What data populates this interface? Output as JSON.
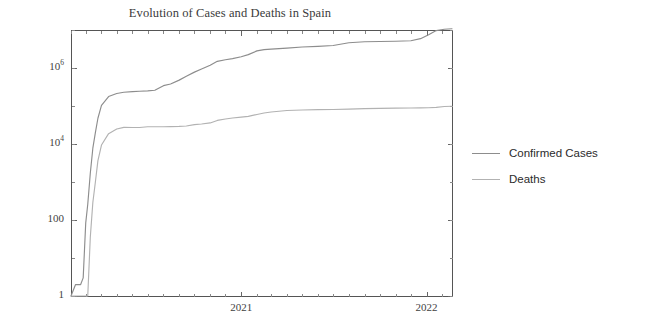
{
  "chart_data": {
    "type": "line",
    "title": "Evolution of Cases and Deaths in Spain",
    "xlabel": "",
    "ylabel": "",
    "yscale": "log",
    "ylim": [
      1,
      10000000
    ],
    "grid": false,
    "legend_position": "right",
    "y_ticks": [
      {
        "value": 1,
        "label": "1",
        "exponent": ""
      },
      {
        "value": 100,
        "label": "100",
        "exponent": ""
      },
      {
        "value": 10000,
        "label": "10",
        "exponent": "4"
      },
      {
        "value": 1000000,
        "label": "10",
        "exponent": "6"
      }
    ],
    "x_ticks": [
      {
        "value": "2021-01",
        "label": "2021"
      },
      {
        "value": "2022-01",
        "label": "2022"
      }
    ],
    "x_range": [
      "2020-02-01",
      "2022-02-20"
    ],
    "series": [
      {
        "name": "Confirmed Cases",
        "color": "#8d8d8d",
        "x": [
          "2020-02-01",
          "2020-02-10",
          "2020-02-20",
          "2020-02-25",
          "2020-03-01",
          "2020-03-05",
          "2020-03-10",
          "2020-03-15",
          "2020-03-20",
          "2020-03-25",
          "2020-04-01",
          "2020-04-15",
          "2020-05-01",
          "2020-05-15",
          "2020-06-01",
          "2020-06-15",
          "2020-07-01",
          "2020-07-15",
          "2020-08-01",
          "2020-08-15",
          "2020-09-01",
          "2020-09-15",
          "2020-10-01",
          "2020-10-15",
          "2020-11-01",
          "2020-11-15",
          "2020-12-01",
          "2020-12-15",
          "2021-01-01",
          "2021-01-15",
          "2021-02-01",
          "2021-02-15",
          "2021-03-01",
          "2021-04-01",
          "2021-05-01",
          "2021-06-01",
          "2021-07-01",
          "2021-08-01",
          "2021-09-01",
          "2021-10-01",
          "2021-11-01",
          "2021-12-01",
          "2021-12-20",
          "2022-01-05",
          "2022-01-20",
          "2022-02-05",
          "2022-02-20"
        ],
        "y": [
          1,
          2,
          2,
          3,
          84,
          259,
          1695,
          7753,
          19980,
          47610,
          104118,
          177633,
          213435,
          230183,
          239932,
          244328,
          249271,
          258855,
          342813,
          377906,
          479554,
          603167,
          778607,
          936560,
          1185678,
          1496864,
          1646192,
          1762212,
          1982544,
          2252164,
          2822805,
          3056035,
          3142358,
          3347512,
          3559222,
          3715454,
          3911345,
          4616000,
          4903021,
          4980163,
          5069515,
          5228972,
          5909971,
          7457453,
          9661511,
          10452000,
          10770000
        ]
      },
      {
        "name": "Deaths",
        "color": "#b2b2b2",
        "x": [
          "2020-02-01",
          "2020-02-10",
          "2020-02-20",
          "2020-02-25",
          "2020-03-01",
          "2020-03-05",
          "2020-03-10",
          "2020-03-15",
          "2020-03-20",
          "2020-03-25",
          "2020-04-01",
          "2020-04-15",
          "2020-05-01",
          "2020-05-15",
          "2020-06-01",
          "2020-06-15",
          "2020-07-01",
          "2020-07-15",
          "2020-08-01",
          "2020-08-15",
          "2020-09-01",
          "2020-09-15",
          "2020-10-01",
          "2020-10-15",
          "2020-11-01",
          "2020-11-15",
          "2020-12-01",
          "2020-12-15",
          "2021-01-01",
          "2021-01-15",
          "2021-02-01",
          "2021-02-15",
          "2021-03-01",
          "2021-04-01",
          "2021-05-01",
          "2021-06-01",
          "2021-07-01",
          "2021-08-01",
          "2021-09-01",
          "2021-10-01",
          "2021-11-01",
          "2021-12-01",
          "2021-12-20",
          "2022-01-05",
          "2022-01-20",
          "2022-02-05",
          "2022-02-20"
        ],
        "y": [
          0,
          0,
          0,
          0,
          0,
          1,
          35,
          288,
          1002,
          3647,
          9387,
          18708,
          24824,
          27321,
          27127,
          27136,
          28368,
          28420,
          28445,
          28605,
          29094,
          29848,
          32225,
          33553,
          35878,
          41688,
          45511,
          48401,
          50837,
          53314,
          59805,
          65449,
          69609,
          76328,
          78399,
          80196,
          81084,
          82407,
          85218,
          86463,
          87673,
          88708,
          89488,
          90136,
          92090,
          97000,
          98400
        ]
      }
    ]
  },
  "legend": {
    "entries": [
      {
        "label": "Confirmed Cases",
        "color": "#8d8d8d"
      },
      {
        "label": "Deaths",
        "color": "#b2b2b2"
      }
    ]
  },
  "axes": {
    "left": 71,
    "right": 452,
    "top": 30,
    "bottom": 296
  }
}
